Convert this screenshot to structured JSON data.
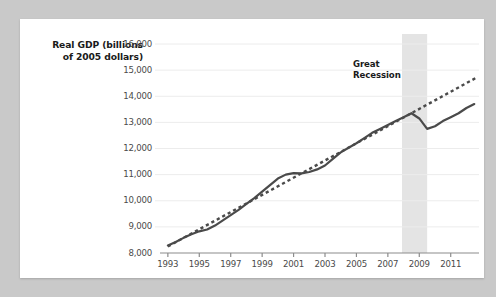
{
  "figure": {
    "background_color": "#c9c9c9",
    "card_color": "#ffffff"
  },
  "annotation": {
    "line1": "Great",
    "line2": "Recession"
  },
  "chart_data": {
    "type": "line",
    "title": "",
    "subtitle": "",
    "xlabel": "",
    "ylabel": "Real GDP (billions of 2005 dollars)",
    "ylabel_line1": "Real GDP (billions",
    "ylabel_line2": "of 2005 dollars)",
    "xlim": [
      1992.5,
      2012.8
    ],
    "ylim": [
      8000,
      16000
    ],
    "grid": true,
    "legend": "none",
    "ytick_labels": [
      "8,000",
      "9,000",
      "10,000",
      "11,000",
      "12,000",
      "13,000",
      "14,000",
      "15,000",
      "16,000"
    ],
    "ytick_values": [
      8000,
      9000,
      10000,
      11000,
      12000,
      13000,
      14000,
      15000,
      16000
    ],
    "xtick_labels": [
      "1993",
      "1995",
      "1997",
      "1999",
      "2001",
      "2003",
      "2005",
      "2007",
      "2009",
      "2011"
    ],
    "xtick_values": [
      1993,
      1995,
      1997,
      1999,
      2001,
      2003,
      2005,
      2007,
      2009,
      2011
    ],
    "shaded_region": {
      "label": "Great Recession",
      "x_start": 2007.9,
      "x_end": 2009.5,
      "color": "#e4e4e4"
    },
    "colors": {
      "actual_line": "#4a4a4a",
      "trend_line": "#4a4a4a",
      "gridline": "#ececec",
      "axis": "#8c8c8c",
      "tick_label": "#4a4a4a"
    },
    "series": [
      {
        "name": "Real GDP (actual)",
        "style": "solid",
        "x": [
          1993.0,
          1993.5,
          1994.0,
          1994.5,
          1995.0,
          1995.5,
          1996.0,
          1996.5,
          1997.0,
          1997.5,
          1998.0,
          1998.5,
          1999.0,
          1999.5,
          2000.0,
          2000.5,
          2001.0,
          2001.5,
          2002.0,
          2002.5,
          2003.0,
          2003.5,
          2004.0,
          2004.5,
          2005.0,
          2005.5,
          2006.0,
          2006.5,
          2007.0,
          2007.5,
          2008.0,
          2008.5,
          2009.0,
          2009.5,
          2010.0,
          2010.5,
          2011.0,
          2011.5,
          2012.0,
          2012.5
        ],
        "values": [
          8290,
          8420,
          8580,
          8720,
          8830,
          8900,
          9050,
          9250,
          9450,
          9650,
          9880,
          10100,
          10350,
          10600,
          10850,
          11000,
          11060,
          11050,
          11100,
          11200,
          11350,
          11600,
          11850,
          12030,
          12200,
          12400,
          12600,
          12750,
          12900,
          13050,
          13200,
          13350,
          13150,
          12750,
          12850,
          13050,
          13200,
          13350,
          13550,
          13700
        ],
        "start_value": 8290,
        "end_value": 13700,
        "peak_before_recession": 13400,
        "trough_value": 12700
      },
      {
        "name": "Trend (potential GDP)",
        "style": "dashed",
        "x": [
          1993.0,
          2012.6
        ],
        "values": [
          8250,
          14700
        ],
        "start_value": 8250,
        "end_value": 14700
      }
    ]
  }
}
